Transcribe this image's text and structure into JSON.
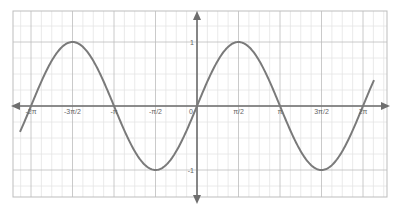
{
  "chart_data": {
    "type": "line",
    "title": "",
    "xlabel": "",
    "ylabel": "",
    "function": "y = sin(x)",
    "xlim": [
      -6.7,
      6.7
    ],
    "ylim": [
      -1.4,
      1.5
    ],
    "grid": true,
    "legend": null,
    "x_ticks": [
      {
        "value": -6.2832,
        "label": "-2π"
      },
      {
        "value": -4.7124,
        "label": "-3π/2"
      },
      {
        "value": -3.1416,
        "label": "-π"
      },
      {
        "value": -1.5708,
        "label": "-π/2"
      },
      {
        "value": 0,
        "label": "0"
      },
      {
        "value": 1.5708,
        "label": "π/2"
      },
      {
        "value": 3.1416,
        "label": "π"
      },
      {
        "value": 4.7124,
        "label": "3π/2"
      },
      {
        "value": 6.2832,
        "label": "2π"
      }
    ],
    "y_ticks": [
      {
        "value": 1,
        "label": "1"
      },
      {
        "value": -1,
        "label": "-1"
      }
    ],
    "series": [
      {
        "name": "sin(x)",
        "color": "#7a7a7a",
        "x": [
          -6.7,
          -6.2832,
          -5.4978,
          -4.7124,
          -3.927,
          -3.1416,
          -2.3562,
          -1.5708,
          -0.7854,
          0,
          0.7854,
          1.5708,
          2.3562,
          3.1416,
          3.927,
          4.7124,
          5.4978,
          6.2832,
          6.7
        ],
        "values": [
          -0.405,
          0,
          0.707,
          1,
          0.707,
          0,
          -0.707,
          -1,
          -0.707,
          0,
          0.707,
          1,
          0.707,
          0,
          -0.707,
          -1,
          -0.707,
          0,
          0.405
        ]
      }
    ],
    "colors": {
      "axis": "#6e6e6e",
      "grid_minor": "#e4e4e4",
      "grid_major": "#bdbdbd",
      "curve": "#7a7a7a",
      "frame": "#bdbdbd"
    }
  }
}
